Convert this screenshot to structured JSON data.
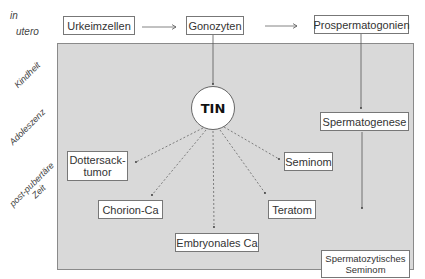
{
  "diagram": {
    "stages": {
      "in_utero_line1": "in",
      "in_utero_line2": "utero",
      "childhood": "Kindheit",
      "adolescence": "Adoleszenz",
      "post_pubertal_line1": "post-pubertäre",
      "post_pubertal_line2": "Zeit"
    },
    "germ_cell_lineage": {
      "primordial": "Urkeimzellen",
      "gonocytes": "Gonozyten",
      "prospermatogonia": "Prospermatogonien"
    },
    "center_node": "TIN",
    "spermatogenesis": "Spermatogenese",
    "tumors": {
      "yolk_sac_line1": "Dottersack-",
      "yolk_sac_line2": "tumor",
      "seminoma": "Seminom",
      "choriocarcinoma": "Chorion-Ca",
      "teratoma": "Teratom",
      "embryonal_carcinoma": "Embryonales Ca",
      "spermatocytic_seminoma_line1": "Spermatozytisches",
      "spermatocytic_seminoma_line2": "Seminom"
    },
    "colors": {
      "panel": "#d9d9d9",
      "box": "#ffffff",
      "line": "#555555"
    }
  }
}
